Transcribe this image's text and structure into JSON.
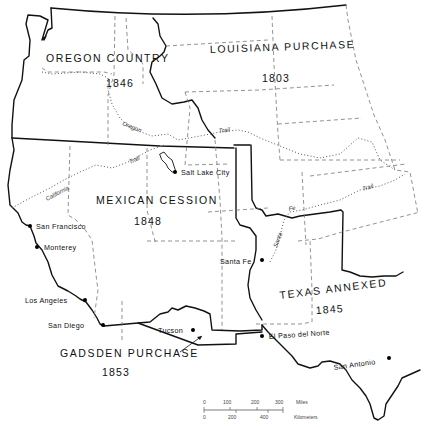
{
  "map": {
    "title": "Westward territorial acquisitions of the United States",
    "regions": [
      {
        "name": "OREGON COUNTRY",
        "year": "1846"
      },
      {
        "name": "LOUISIANA PURCHASE",
        "year": "1803"
      },
      {
        "name": "MEXICAN CESSION",
        "year": "1848"
      },
      {
        "name": "TEXAS ANNEXED",
        "year": "1845"
      },
      {
        "name": "GADSDEN PURCHASE",
        "year": "1853"
      }
    ],
    "cities": [
      {
        "name": "Salt Lake City"
      },
      {
        "name": "San Francisco"
      },
      {
        "name": "Monterey"
      },
      {
        "name": "Los Angeles"
      },
      {
        "name": "San Diego"
      },
      {
        "name": "Tucson"
      },
      {
        "name": "Santa Fe"
      },
      {
        "name": "El Paso del Norte"
      },
      {
        "name": "San Antonio"
      }
    ],
    "trails": [
      {
        "label_1": "Oregon",
        "label_2": "Trail",
        "label_3": "Trail"
      },
      {
        "label_1": "California",
        "label_2": "Trail"
      },
      {
        "label_1": "Santa",
        "label_2": "Fe",
        "label_3": "Trail"
      }
    ],
    "scale": {
      "miles_ticks": [
        "0",
        "100",
        "200",
        "300"
      ],
      "miles_unit": "Miles",
      "km_ticks": [
        "0",
        "200",
        "400"
      ],
      "km_unit": "Kilometers"
    }
  }
}
